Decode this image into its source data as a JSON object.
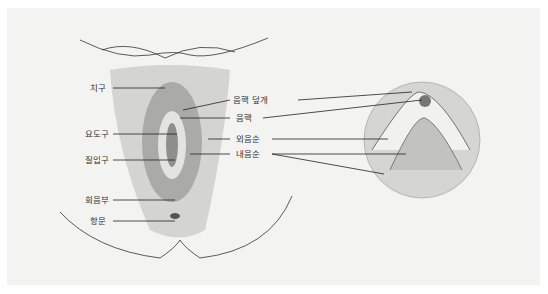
{
  "figure": {
    "type": "anatomical-diagram",
    "background": "#f3f3f1",
    "line_color": "#333333"
  },
  "left_labels": [
    {
      "id": "mons",
      "text": "치구",
      "x": 90,
      "y": 85
    },
    {
      "id": "urethral-opening",
      "text": "요도구",
      "x": 85,
      "y": 131
    },
    {
      "id": "vaginal-opening",
      "text": "질입구",
      "x": 85,
      "y": 157
    },
    {
      "id": "perineum",
      "text": "회음부",
      "x": 85,
      "y": 197
    },
    {
      "id": "anus",
      "text": "항문",
      "x": 90,
      "y": 219
    }
  ],
  "right_labels": [
    {
      "id": "clitoral-hood",
      "text": "음핵 덮개",
      "x": 233,
      "y": 97
    },
    {
      "id": "clitoris",
      "text": "음핵",
      "x": 233,
      "y": 116
    },
    {
      "id": "labia-majora",
      "text": "외음순",
      "x": 233,
      "y": 137
    },
    {
      "id": "labia-minora",
      "text": "내음순",
      "x": 233,
      "y": 152
    }
  ]
}
